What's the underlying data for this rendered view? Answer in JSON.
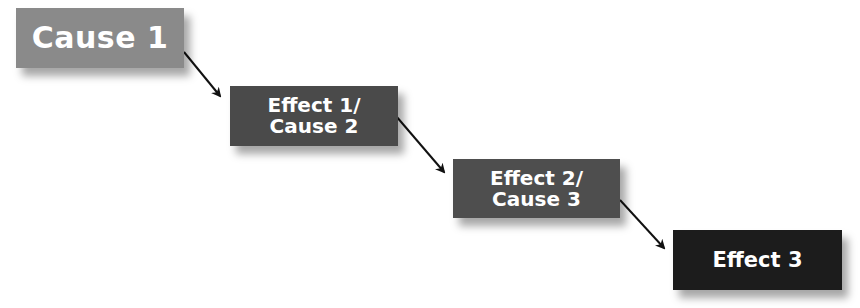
{
  "diagram": {
    "type": "cause-effect chain",
    "nodes": [
      {
        "id": "n1",
        "label": "Cause 1",
        "color": "#8a8a8a"
      },
      {
        "id": "n2",
        "label": "Effect 1/\nCause 2",
        "color": "#4a4a4a"
      },
      {
        "id": "n3",
        "label": "Effect 2/\nCause 3",
        "color": "#4e4e4e"
      },
      {
        "id": "n4",
        "label": "Effect 3",
        "color": "#1c1c1c"
      }
    ],
    "edges": [
      {
        "from": "n1",
        "to": "n2"
      },
      {
        "from": "n2",
        "to": "n3"
      },
      {
        "from": "n3",
        "to": "n4"
      }
    ],
    "arrow_color": "#111111"
  }
}
